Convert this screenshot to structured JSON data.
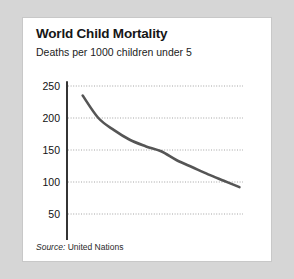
{
  "card": {
    "title": "World Child Mortality",
    "subtitle": "Deaths per 1000 children under 5",
    "source_label": "Source:",
    "source_value": " United Nations"
  },
  "chart_data": {
    "type": "line",
    "title": "World Child Mortality",
    "subtitle": "Deaths per 1000 children under 5",
    "xlabel": "",
    "ylabel": "Deaths per 1000 children under 5",
    "xlim": [
      1950,
      2000
    ],
    "ylim": [
      0,
      250
    ],
    "xticks": [
      1950,
      1960,
      1970,
      1980,
      1990,
      2000
    ],
    "yticks": [
      0,
      50,
      100,
      150,
      200,
      250
    ],
    "grid": "horizontal-dotted",
    "legend": "none",
    "line_color": "#555555",
    "axis_color": "#111111",
    "grid_color": "#9a9a9a",
    "source": "Source: United Nations",
    "series": [
      {
        "name": "Under-5 deaths per 1000",
        "x": [
          1954,
          1958,
          1962,
          1966,
          1970,
          1974,
          1978,
          1982,
          1986,
          1990,
          1994
        ],
        "values": [
          235,
          200,
          181,
          166,
          156,
          148,
          134,
          123,
          112,
          102,
          92
        ]
      }
    ]
  }
}
